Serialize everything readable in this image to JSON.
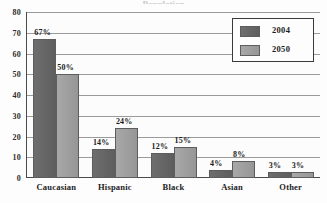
{
  "chart_data": {
    "type": "bar",
    "title": "",
    "title_remnant": "Population",
    "xlabel": "",
    "ylabel": "",
    "categories": [
      "Caucasian",
      "Hispanic",
      "Black",
      "Asian",
      "Other"
    ],
    "series": [
      {
        "name": "2004",
        "color": "#656565",
        "values": [
          67,
          14,
          12,
          4,
          3
        ],
        "labels": [
          "67%",
          "14%",
          "12%",
          "4%",
          "3%"
        ]
      },
      {
        "name": "2050",
        "color": "#9e9e9e",
        "values": [
          50,
          24,
          15,
          8,
          3
        ],
        "labels": [
          "50%",
          "24%",
          "15%",
          "8%",
          "3%"
        ]
      }
    ],
    "ylim": [
      0,
      80
    ],
    "yticks": [
      80,
      70,
      60,
      50,
      40,
      30,
      20,
      10,
      0
    ],
    "ytick_labels": [
      "80",
      "70",
      "60",
      "50",
      "40",
      "30",
      "20",
      "10",
      "0"
    ],
    "grid": true,
    "grid_color": "#9a9a9a",
    "legend_position": "top-right",
    "legend_entries": [
      "2004",
      "2050"
    ],
    "axis_color": "#4a4a4a",
    "background": "#fcfcfc"
  }
}
